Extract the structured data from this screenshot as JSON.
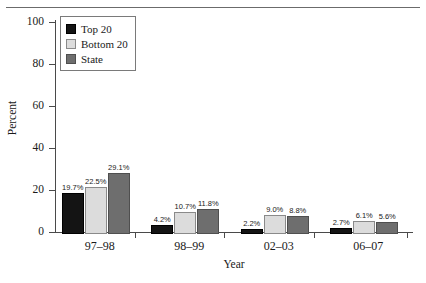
{
  "chart_data": {
    "type": "bar",
    "title": "",
    "xlabel": "Year",
    "ylabel": "Percent",
    "ylim": [
      0,
      100
    ],
    "yticks": [
      0,
      20,
      40,
      60,
      80,
      100
    ],
    "grid": false,
    "legend_position": "top-left",
    "categories": [
      "97–98",
      "98–99",
      "02–03",
      "06–07"
    ],
    "series": [
      {
        "name": "Top 20",
        "color": "#141414",
        "values": [
          19.7,
          4.2,
          2.2,
          2.7
        ],
        "labels": [
          "19.7%",
          "4.2%",
          "2.2%",
          "2.7%"
        ]
      },
      {
        "name": "Bottom 20",
        "color": "#dcdcdc",
        "values": [
          22.5,
          10.7,
          9.0,
          6.1
        ],
        "labels": [
          "22.5%",
          "10.7%",
          "9.0%",
          "6.1%"
        ]
      },
      {
        "name": "State",
        "color": "#6e6e6e",
        "values": [
          29.1,
          11.8,
          8.8,
          5.6
        ],
        "labels": [
          "29.1%",
          "11.8%",
          "8.8%",
          "5.6%"
        ]
      }
    ]
  },
  "axis": {
    "y_tick_labels": [
      "100",
      "80",
      "60",
      "40",
      "20",
      "0"
    ],
    "y_title": "Percent",
    "x_title": "Year",
    "x_tick_labels": [
      "97–98",
      "98–99",
      "02–03",
      "06–07"
    ]
  },
  "legend": {
    "items": [
      {
        "label": "Top 20"
      },
      {
        "label": "Bottom 20"
      },
      {
        "label": "State"
      }
    ]
  }
}
